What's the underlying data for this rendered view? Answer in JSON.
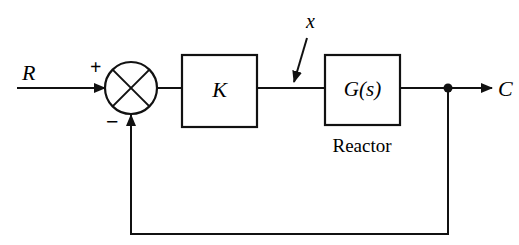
{
  "diagram": {
    "type": "feedback-control-block-diagram",
    "colors": {
      "line": "#111111",
      "background": "#ffffff"
    },
    "input": {
      "label": "R"
    },
    "summing_junction": {
      "plus_sign": "+",
      "minus_sign": "−"
    },
    "controller": {
      "label": "K"
    },
    "disturbance": {
      "label": "x"
    },
    "plant": {
      "label": "G(s)",
      "caption": "Reactor"
    },
    "output": {
      "label": "C"
    }
  }
}
